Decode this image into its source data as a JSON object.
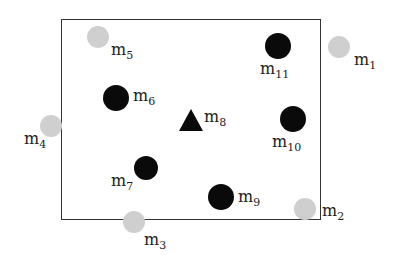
{
  "diagram": {
    "nodes": [
      {
        "id": "m1",
        "label": "m",
        "sub": "1",
        "color": "gray",
        "x": 339,
        "y": 47
      },
      {
        "id": "m2",
        "label": "m",
        "sub": "2",
        "color": "gray",
        "x": 305,
        "y": 209
      },
      {
        "id": "m3",
        "label": "m",
        "sub": "3",
        "color": "gray",
        "x": 134,
        "y": 222
      },
      {
        "id": "m4",
        "label": "m",
        "sub": "4",
        "color": "gray",
        "x": 51,
        "y": 126
      },
      {
        "id": "m5",
        "label": "m",
        "sub": "5",
        "color": "gray",
        "x": 98,
        "y": 37
      },
      {
        "id": "m6",
        "label": "m",
        "sub": "6",
        "color": "black",
        "x": 116,
        "y": 98
      },
      {
        "id": "m7",
        "label": "m",
        "sub": "7",
        "color": "black",
        "x": 146,
        "y": 168
      },
      {
        "id": "m8",
        "label": "m",
        "sub": "8",
        "color": "black",
        "shape": "triangle",
        "x": 191,
        "y": 120
      },
      {
        "id": "m9",
        "label": "m",
        "sub": "9",
        "color": "black",
        "x": 221,
        "y": 197
      },
      {
        "id": "m10",
        "label": "m",
        "sub": "10",
        "color": "black",
        "x": 293,
        "y": 119
      },
      {
        "id": "m11",
        "label": "m",
        "sub": "11",
        "color": "black",
        "x": 278,
        "y": 46
      }
    ],
    "colors": {
      "black": "#0a0a0a",
      "gray": "#cfcfcf",
      "frame": "#333333"
    }
  }
}
